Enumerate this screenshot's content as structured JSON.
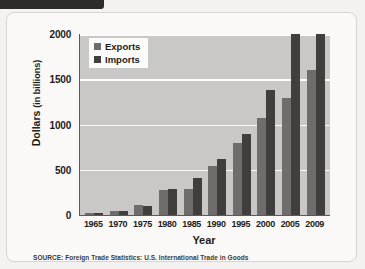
{
  "figure": {
    "source_note": "SOURCE: Foreign Trade Statistics: U.S. International Trade in Goods"
  },
  "legend": {
    "items": [
      {
        "label": "Exports",
        "color": "#6e6d6b"
      },
      {
        "label": "Imports",
        "color": "#403f3e"
      }
    ]
  },
  "chart_data": {
    "type": "bar",
    "title": "",
    "xlabel": "Year",
    "ylabel": "Dollars (in billions)",
    "ylabel_main": "Dollars",
    "ylabel_unit": "(in billions)",
    "categories": [
      "1965",
      "1970",
      "1975",
      "1980",
      "1985",
      "1990",
      "1995",
      "2000",
      "2005",
      "2009"
    ],
    "series": [
      {
        "name": "Exports",
        "color": "#6e6d6b",
        "values": [
          27,
          43,
          108,
          272,
          289,
          537,
          795,
          1070,
          1290,
          1600
        ]
      },
      {
        "name": "Imports",
        "color": "#403f3e",
        "values": [
          21,
          40,
          98,
          291,
          410,
          616,
          891,
          1380,
          2000,
          2000
        ]
      }
    ],
    "ylim": [
      0,
      2000
    ],
    "yticks": [
      0,
      500,
      1000,
      1500,
      2000
    ],
    "ytick_labels": [
      "0",
      "500",
      "1000",
      "1500",
      "2000"
    ],
    "grid": true,
    "legend_position": "top-left",
    "plot_background": "#c9c8c6"
  }
}
